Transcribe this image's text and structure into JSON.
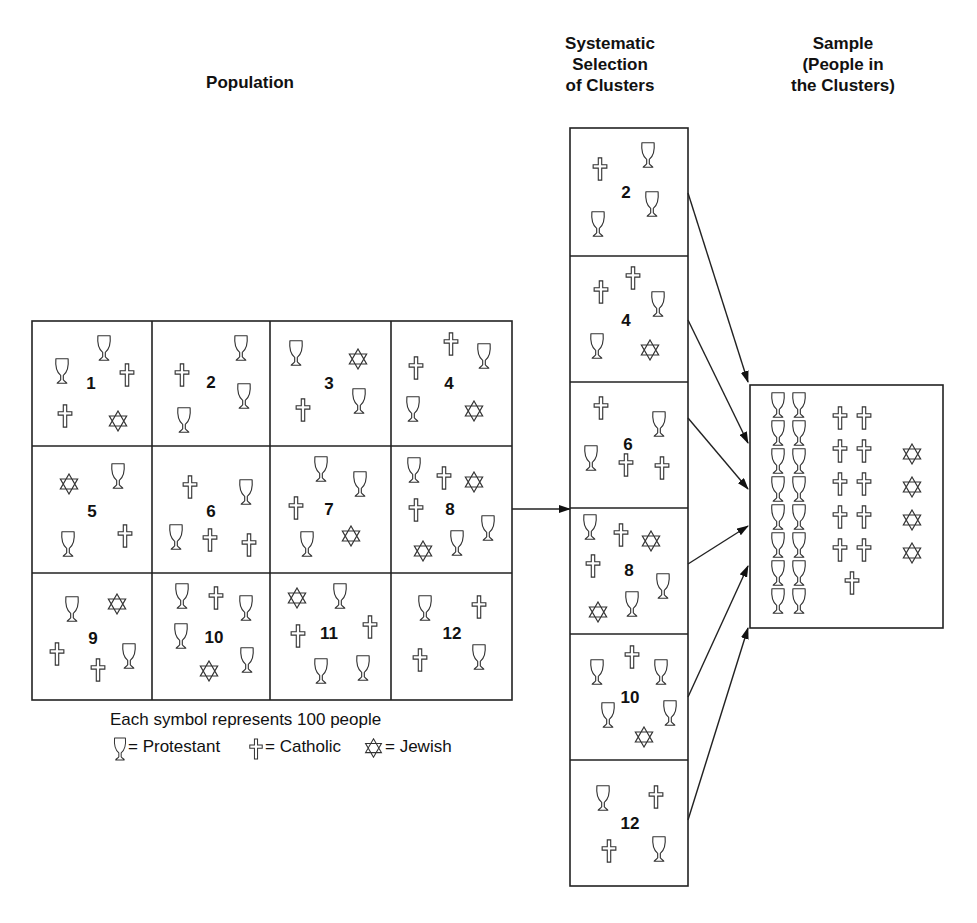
{
  "titles": {
    "population": "Population",
    "selection": [
      "Systematic",
      "Selection",
      "of Clusters"
    ],
    "sample": [
      "Sample",
      "(People in",
      "the Clusters)"
    ]
  },
  "legend": {
    "note": "Each symbol represents 100 people",
    "items": [
      {
        "symbol": "chalice-icon",
        "label": "= Protestant"
      },
      {
        "symbol": "cross-icon",
        "label": "= Catholic"
      },
      {
        "symbol": "star-of-david-icon",
        "label": "= Jewish"
      }
    ]
  },
  "population_clusters": [
    {
      "id": "1",
      "label": [
        91,
        383
      ],
      "symbols": [
        [
          "P",
          104,
          348
        ],
        [
          "P",
          62,
          371
        ],
        [
          "C",
          127,
          375
        ],
        [
          "C",
          65,
          416
        ],
        [
          "J",
          118,
          421
        ]
      ]
    },
    {
      "id": "2",
      "label": [
        211,
        382
      ],
      "symbols": [
        [
          "P",
          241,
          348
        ],
        [
          "C",
          182,
          375
        ],
        [
          "P",
          244,
          396
        ],
        [
          "P",
          184,
          420
        ]
      ]
    },
    {
      "id": "3",
      "label": [
        329,
        383
      ],
      "symbols": [
        [
          "P",
          296,
          353
        ],
        [
          "J",
          358,
          359
        ],
        [
          "C",
          303,
          410
        ],
        [
          "P",
          359,
          401
        ]
      ]
    },
    {
      "id": "4",
      "label": [
        449,
        383
      ],
      "symbols": [
        [
          "C",
          451,
          344
        ],
        [
          "P",
          484,
          356
        ],
        [
          "C",
          416,
          368
        ],
        [
          "P",
          413,
          409
        ],
        [
          "J",
          474,
          411
        ]
      ]
    },
    {
      "id": "5",
      "label": [
        92,
        511
      ],
      "symbols": [
        [
          "J",
          69,
          484
        ],
        [
          "P",
          118,
          476
        ],
        [
          "P",
          68,
          544
        ],
        [
          "C",
          125,
          536
        ]
      ]
    },
    {
      "id": "6",
      "label": [
        211,
        511
      ],
      "symbols": [
        [
          "C",
          190,
          487
        ],
        [
          "P",
          246,
          492
        ],
        [
          "P",
          176,
          537
        ],
        [
          "C",
          210,
          540
        ],
        [
          "C",
          249,
          545
        ]
      ]
    },
    {
      "id": "7",
      "label": [
        329,
        509
      ],
      "symbols": [
        [
          "P",
          321,
          469
        ],
        [
          "P",
          360,
          484
        ],
        [
          "C",
          296,
          508
        ],
        [
          "P",
          307,
          544
        ],
        [
          "J",
          351,
          536
        ]
      ]
    },
    {
      "id": "8",
      "label": [
        450,
        509
      ],
      "symbols": [
        [
          "P",
          414,
          470
        ],
        [
          "C",
          444,
          478
        ],
        [
          "J",
          474,
          482
        ],
        [
          "C",
          416,
          510
        ],
        [
          "P",
          488,
          528
        ],
        [
          "P",
          457,
          543
        ],
        [
          "J",
          423,
          551
        ]
      ]
    },
    {
      "id": "9",
      "label": [
        93,
        638
      ],
      "symbols": [
        [
          "P",
          72,
          609
        ],
        [
          "J",
          117,
          604
        ],
        [
          "C",
          57,
          654
        ],
        [
          "C",
          98,
          670
        ],
        [
          "P",
          129,
          656
        ]
      ]
    },
    {
      "id": "10",
      "label": [
        214,
        637
      ],
      "symbols": [
        [
          "P",
          182,
          596
        ],
        [
          "C",
          216,
          598
        ],
        [
          "P",
          246,
          608
        ],
        [
          "P",
          181,
          636
        ],
        [
          "J",
          209,
          671
        ],
        [
          "P",
          247,
          660
        ]
      ]
    },
    {
      "id": "11",
      "label": [
        329,
        633
      ],
      "symbols": [
        [
          "J",
          297,
          598
        ],
        [
          "P",
          340,
          596
        ],
        [
          "C",
          298,
          636
        ],
        [
          "C",
          370,
          627
        ],
        [
          "P",
          321,
          671
        ],
        [
          "P",
          363,
          668
        ]
      ]
    },
    {
      "id": "12",
      "label": [
        452,
        633
      ],
      "symbols": [
        [
          "P",
          425,
          608
        ],
        [
          "C",
          479,
          607
        ],
        [
          "C",
          420,
          660
        ],
        [
          "P",
          479,
          657
        ]
      ]
    }
  ],
  "selected_clusters": [
    {
      "id": "2",
      "label": [
        626,
        192
      ],
      "symbols": [
        [
          "C",
          600,
          169
        ],
        [
          "P",
          648,
          155
        ],
        [
          "P",
          652,
          204
        ],
        [
          "P",
          598,
          224
        ]
      ]
    },
    {
      "id": "4",
      "label": [
        626,
        320
      ],
      "symbols": [
        [
          "C",
          601,
          292
        ],
        [
          "C",
          633,
          278
        ],
        [
          "P",
          658,
          304
        ],
        [
          "P",
          597,
          346
        ],
        [
          "J",
          650,
          350
        ]
      ]
    },
    {
      "id": "6",
      "label": [
        628,
        444
      ],
      "symbols": [
        [
          "C",
          601,
          408
        ],
        [
          "P",
          659,
          424
        ],
        [
          "P",
          591,
          458
        ],
        [
          "C",
          626,
          465
        ],
        [
          "C",
          662,
          468
        ]
      ]
    },
    {
      "id": "8",
      "label": [
        629,
        570
      ],
      "symbols": [
        [
          "P",
          590,
          527
        ],
        [
          "C",
          621,
          535
        ],
        [
          "J",
          651,
          541
        ],
        [
          "C",
          593,
          566
        ],
        [
          "P",
          663,
          586
        ],
        [
          "P",
          632,
          604
        ],
        [
          "J",
          598,
          612
        ]
      ]
    },
    {
      "id": "10",
      "label": [
        630,
        697
      ],
      "symbols": [
        [
          "P",
          597,
          672
        ],
        [
          "C",
          632,
          657
        ],
        [
          "P",
          661,
          672
        ],
        [
          "P",
          608,
          715
        ],
        [
          "P",
          670,
          713
        ],
        [
          "J",
          644,
          737
        ]
      ]
    },
    {
      "id": "12",
      "label": [
        630,
        823
      ],
      "symbols": [
        [
          "P",
          603,
          798
        ],
        [
          "C",
          656,
          797
        ],
        [
          "C",
          609,
          851
        ],
        [
          "P",
          659,
          849
        ]
      ]
    }
  ],
  "sample": {
    "protestant_count": 16,
    "catholic_count": 11,
    "jewish_count": 4
  },
  "colors": {
    "line": "#222222",
    "background": "#ffffff"
  }
}
